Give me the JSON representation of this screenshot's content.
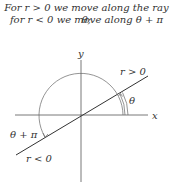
{
  "caption": {
    "line1": "For r > 0 we move along the ray θ;",
    "line2": "for r < 0 we move along θ + π"
  },
  "diagram": {
    "x_axis_label": "x",
    "y_axis_label": "y",
    "positive_ray_label": "r > 0",
    "negative_ray_label": "r < 0",
    "angle_label": "θ",
    "angle_plus_pi_label": "θ + π"
  }
}
